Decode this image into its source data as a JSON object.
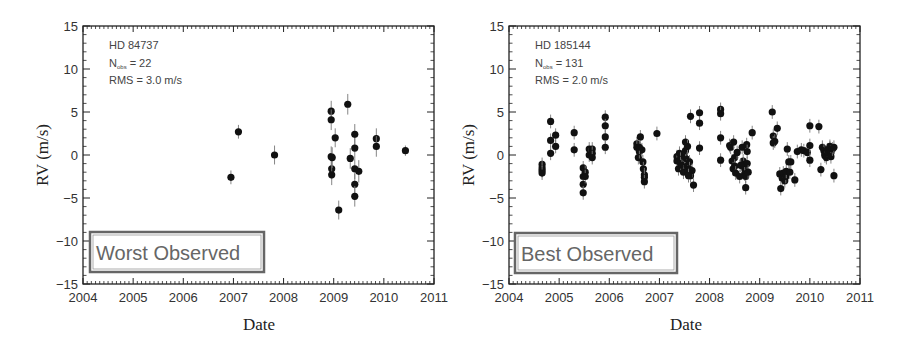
{
  "chart_data": [
    {
      "type": "scatter",
      "title": "",
      "xlabel": "Date",
      "ylabel": "RV (m/s)",
      "xlim": [
        2004,
        2011
      ],
      "ylim": [
        -15,
        15
      ],
      "xticks": [
        "2004",
        "2005",
        "2006",
        "2007",
        "2008",
        "2009",
        "2010",
        "2011"
      ],
      "yticks": [
        "15",
        "10",
        "5",
        "0",
        "−10",
        "−15"
      ],
      "ytick_values": [
        15,
        10,
        5,
        0,
        -5,
        -10,
        -15
      ],
      "ytick_labels": [
        "15",
        "10",
        "5",
        "0",
        "−5",
        "−10",
        "−15"
      ],
      "star": "HD 84737",
      "nobs_label": "N",
      "nobs_sub": "obs",
      "nobs_value": "= 22",
      "rms": "RMS = 3.0 m/s",
      "badge": "Worst Observed",
      "grid": false,
      "series": [
        {
          "name": "HD 84737",
          "x": [
            2006.95,
            2007.1,
            2007.82,
            2008.95,
            2008.95,
            2008.95,
            2008.96,
            2008.96,
            2008.97,
            2009.03,
            2009.1,
            2009.28,
            2009.33,
            2009.42,
            2009.42,
            2009.42,
            2009.42,
            2009.42,
            2009.5,
            2009.85,
            2009.85,
            2010.43
          ],
          "y": [
            -2.6,
            2.7,
            0.0,
            5.1,
            4.1,
            -0.2,
            -1.6,
            -2.3,
            -0.3,
            2.0,
            -6.4,
            5.9,
            -0.4,
            2.4,
            0.8,
            -1.6,
            -3.4,
            -4.8,
            -1.9,
            1.9,
            1.0,
            0.5
          ],
          "err": [
            0.8,
            0.8,
            1.1,
            1.2,
            1.2,
            1.2,
            1.2,
            1.2,
            1.2,
            1.1,
            1.1,
            1.2,
            1.2,
            1.2,
            1.2,
            1.2,
            1.2,
            1.2,
            1.3,
            1.2,
            1.2,
            0.6
          ]
        }
      ]
    },
    {
      "type": "scatter",
      "title": "",
      "xlabel": "Date",
      "ylabel": "RV (m/s)",
      "xlim": [
        2004,
        2011
      ],
      "ylim": [
        -15,
        15
      ],
      "xticks": [
        "2004",
        "2005",
        "2006",
        "2007",
        "2008",
        "2009",
        "2010",
        "2011"
      ],
      "ytick_values": [
        15,
        10,
        5,
        0,
        -5,
        -10,
        -15
      ],
      "ytick_labels": [
        "15",
        "10",
        "5",
        "0",
        "−5",
        "−10",
        "−15"
      ],
      "star": "HD 185144",
      "nobs_label": "N",
      "nobs_sub": "obs",
      "nobs_value": "= 131",
      "rms": "RMS = 2.0 m/s",
      "badge": "Best Observed",
      "grid": false,
      "series": [
        {
          "name": "HD 185144",
          "x": [
            2004.66,
            2004.66,
            2004.66,
            2004.66,
            2004.83,
            2004.83,
            2004.83,
            2004.93,
            2004.93,
            2005.3,
            2005.3,
            2005.48,
            2005.48,
            2005.48,
            2005.48,
            2005.52,
            2005.52,
            2005.6,
            2005.6,
            2005.66,
            2005.66,
            2005.66,
            2005.92,
            2005.92,
            2005.92,
            2005.92,
            2006.55,
            2006.55,
            2006.58,
            2006.6,
            2006.62,
            2006.65,
            2006.67,
            2006.68,
            2006.7,
            2006.7,
            2006.7,
            2006.95,
            2007.35,
            2007.35,
            2007.38,
            2007.4,
            2007.42,
            2007.42,
            2007.45,
            2007.48,
            2007.5,
            2007.52,
            2007.52,
            2007.55,
            2007.55,
            2007.57,
            2007.6,
            2007.6,
            2007.62,
            2007.62,
            2007.65,
            2007.68,
            2007.8,
            2007.8,
            2007.8,
            2008.22,
            2008.22,
            2008.22,
            2008.22,
            2008.4,
            2008.42,
            2008.45,
            2008.47,
            2008.48,
            2008.5,
            2008.5,
            2008.52,
            2008.55,
            2008.65,
            2008.67,
            2008.68,
            2008.7,
            2008.7,
            2008.72,
            2008.72,
            2008.74,
            2008.75,
            2008.75,
            2008.77,
            2008.85,
            2009.25,
            2009.27,
            2009.27,
            2009.3,
            2009.35,
            2009.4,
            2009.42,
            2009.45,
            2009.47,
            2009.5,
            2009.52,
            2009.53,
            2009.55,
            2009.58,
            2009.6,
            2009.62,
            2009.7,
            2009.75,
            2009.83,
            2009.88,
            2009.95,
            2010.0,
            2010.0,
            2010.0,
            2010.18,
            2010.22,
            2010.25,
            2010.28,
            2010.3,
            2010.3,
            2010.33,
            2010.35,
            2010.38,
            2010.4,
            2010.4,
            2010.42,
            2010.42,
            2010.45,
            2010.48,
            2010.48,
            2008.6,
            2008.62,
            2007.58,
            2007.56,
            2006.6
          ],
          "y": [
            -1.1,
            -1.5,
            -1.8,
            -2.1,
            3.9,
            1.7,
            0.2,
            2.3,
            1.0,
            2.6,
            0.6,
            -1.5,
            -2.5,
            -3.4,
            -4.4,
            -2.0,
            -2.5,
            0.7,
            0.0,
            0.7,
            0.2,
            -0.3,
            4.4,
            3.4,
            2.1,
            0.9,
            1.3,
            0.9,
            -0.3,
            0.4,
            2.1,
            0.6,
            -0.8,
            -1.6,
            -2.3,
            -2.6,
            -3.1,
            2.5,
            -0.2,
            -0.7,
            -1.6,
            0.2,
            -0.5,
            -1.0,
            -1.2,
            -2.0,
            -0.2,
            1.5,
            0.5,
            -0.5,
            -1.3,
            -2.0,
            -0.8,
            -1.6,
            -2.4,
            4.5,
            -1.8,
            -3.5,
            4.9,
            3.7,
            0.8,
            5.3,
            4.8,
            2.0,
            -0.6,
            1.1,
            0.9,
            -0.7,
            -1.6,
            1.5,
            -0.3,
            -1.3,
            -2.1,
            0.3,
            0.9,
            -0.7,
            -1.1,
            -1.6,
            -2.2,
            -2.5,
            -3.8,
            1.2,
            0.4,
            -1.0,
            -2.0,
            2.6,
            5.0,
            2.2,
            1.4,
            1.6,
            3.1,
            -2.2,
            -3.9,
            -2.7,
            -2.1,
            -3.0,
            -2.5,
            -1.9,
            0.7,
            -0.8,
            -2.0,
            -0.8,
            -2.9,
            0.4,
            0.6,
            0.5,
            0.3,
            3.4,
            1.1,
            -0.6,
            3.3,
            -1.7,
            0.9,
            0.5,
            0.1,
            -0.1,
            -0.3,
            0.6,
            0.2,
            0.8,
            1.0,
            0.3,
            -0.2,
            0.7,
            0.9,
            -2.4,
            -2.5,
            -1.2,
            -2.4,
            1.0,
            0.9
          ],
          "err": 0.8
        }
      ]
    }
  ]
}
